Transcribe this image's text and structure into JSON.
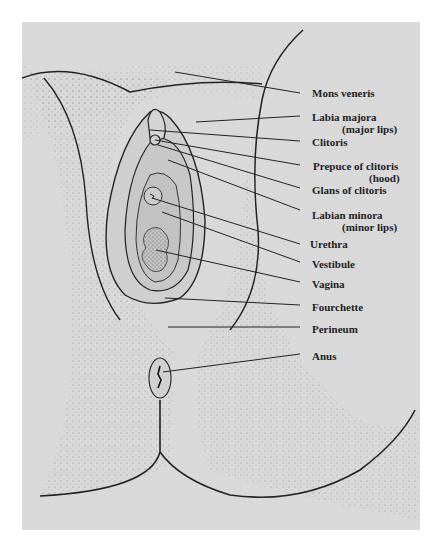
{
  "diagram": {
    "type": "anatomical-illustration",
    "background_color": "#d9d9d9",
    "line_color": "#222222",
    "labels": [
      {
        "id": "mons",
        "text": "Mons veneris",
        "sub": ""
      },
      {
        "id": "labia-majora",
        "text": "Labia majora",
        "sub": "(major lips)"
      },
      {
        "id": "clitoris",
        "text": "Clitoris",
        "sub": ""
      },
      {
        "id": "prepuce",
        "text": "Prepuce of clitoris",
        "sub": "(hood)"
      },
      {
        "id": "glans",
        "text": "Glans of clitoris",
        "sub": ""
      },
      {
        "id": "labia-minora",
        "text": "Labian minora",
        "sub": "(minor lips)"
      },
      {
        "id": "urethra",
        "text": "Urethra",
        "sub": ""
      },
      {
        "id": "vestibule",
        "text": "Vestibule",
        "sub": ""
      },
      {
        "id": "vagina",
        "text": "Vagina",
        "sub": ""
      },
      {
        "id": "fourchette",
        "text": "Fourchette",
        "sub": ""
      },
      {
        "id": "perineum",
        "text": "Perineum",
        "sub": ""
      },
      {
        "id": "anus",
        "text": "Anus",
        "sub": ""
      }
    ]
  }
}
